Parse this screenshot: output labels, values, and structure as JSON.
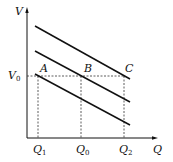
{
  "diagram": {
    "axes": {
      "x_label": "Q",
      "y_label": "V",
      "y_tick_label": "V",
      "y_tick_sub": "0"
    },
    "points": [
      {
        "label": "A"
      },
      {
        "label": "B"
      },
      {
        "label": "C"
      }
    ],
    "x_ticks": [
      {
        "label": "Q",
        "sub": "1"
      },
      {
        "label": "Q",
        "sub": "0"
      },
      {
        "label": "Q",
        "sub": "2"
      }
    ],
    "lines": [
      {
        "name": "upper"
      },
      {
        "name": "middle"
      },
      {
        "name": "lower"
      }
    ],
    "colors": {
      "line": "#111111",
      "dashed": "#333333"
    }
  }
}
